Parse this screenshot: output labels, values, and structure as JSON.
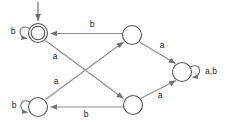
{
  "diagram": {
    "type": "finite-state-automaton",
    "alphabet": [
      "a",
      "b"
    ],
    "states": [
      {
        "id": "q0",
        "name": "accepting-state",
        "accepting": true,
        "start": true,
        "cx": 38,
        "cy": 33,
        "r": 9.5
      },
      {
        "id": "q1",
        "name": "top-middle-state",
        "accepting": false,
        "start": false,
        "cx": 132,
        "cy": 35,
        "r": 9.5
      },
      {
        "id": "q2",
        "name": "bottom-left-state",
        "accepting": false,
        "start": false,
        "cx": 38,
        "cy": 107,
        "r": 9.5
      },
      {
        "id": "q3",
        "name": "bottom-middle-state",
        "accepting": false,
        "start": false,
        "cx": 133,
        "cy": 105,
        "r": 9.5
      },
      {
        "id": "q4",
        "name": "trap-state",
        "accepting": false,
        "start": false,
        "cx": 182,
        "cy": 72,
        "r": 9.5
      }
    ],
    "transitions": [
      {
        "from": "q1",
        "to": "q0",
        "label": "b",
        "label_x": 92,
        "label_y": 25
      },
      {
        "from": "q0",
        "to": "q3",
        "label": "a",
        "label_x": 55,
        "label_y": 57
      },
      {
        "from": "q2",
        "to": "q1",
        "label": "a",
        "label_x": 56,
        "label_y": 82
      },
      {
        "from": "q1",
        "to": "q4",
        "label": "a",
        "label_x": 162,
        "label_y": 46
      },
      {
        "from": "q3",
        "to": "q4",
        "label": "a",
        "label_x": 160,
        "label_y": 96
      },
      {
        "from": "q3",
        "to": "q2",
        "label": "b",
        "label_x": 86,
        "label_y": 115
      }
    ],
    "self_loops": [
      {
        "state": "q0",
        "label": "b",
        "label_x": 13,
        "label_y": 32
      },
      {
        "state": "q2",
        "label": "b",
        "label_x": 14,
        "label_y": 106
      },
      {
        "state": "q4",
        "label": "a,b",
        "label_x": 211,
        "label_y": 72
      }
    ],
    "start_marker": {
      "name": "start-arrow",
      "x": 38,
      "y_from": 2,
      "y_to": 22
    },
    "colors": {
      "background": "#ffffff",
      "state_stroke": "#555555",
      "edge_stroke": "#8d8d8d",
      "label_text": "#1a1a1a"
    }
  }
}
